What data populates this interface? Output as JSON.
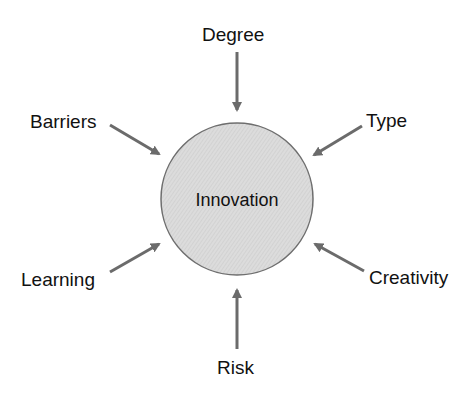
{
  "diagram": {
    "type": "hub-and-spoke",
    "center": {
      "label": "Innovation",
      "fill": "#d9d9d9",
      "stroke": "#666666"
    },
    "arrow_color": "#6b6b6b",
    "factors": [
      {
        "id": "degree",
        "label": "Degree",
        "position": "top"
      },
      {
        "id": "type",
        "label": "Type",
        "position": "top-right"
      },
      {
        "id": "creativity",
        "label": "Creativity",
        "position": "bottom-right"
      },
      {
        "id": "risk",
        "label": "Risk",
        "position": "bottom"
      },
      {
        "id": "learning",
        "label": "Learning",
        "position": "bottom-left"
      },
      {
        "id": "barriers",
        "label": "Barriers",
        "position": "top-left"
      }
    ],
    "relationship": "each factor points into Innovation"
  }
}
